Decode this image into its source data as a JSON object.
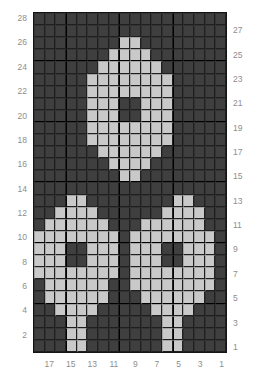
{
  "chart": {
    "type": "grid-pattern",
    "columns": 18,
    "rows": 28,
    "colors": {
      "background_stitch": "#3f3f3f",
      "motif_stitch": "#c9c9c9",
      "gridline": "#1f1f1f",
      "heavy_gridline": "#000000",
      "label": "#8e8e8e"
    },
    "left_axis_labels": [
      "28",
      "26",
      "24",
      "22",
      "20",
      "18",
      "16",
      "14",
      "12",
      "10",
      "8",
      "6",
      "4",
      "2"
    ],
    "right_axis_labels": [
      "27",
      "25",
      "23",
      "21",
      "19",
      "17",
      "15",
      "13",
      "11",
      "9",
      "7",
      "5",
      "3",
      "1"
    ],
    "bottom_axis_labels": [
      "17",
      "15",
      "13",
      "11",
      "9",
      "7",
      "5",
      "3",
      "1"
    ],
    "left_axis_rows": [
      28,
      26,
      24,
      22,
      20,
      18,
      16,
      14,
      12,
      10,
      8,
      6,
      4,
      2
    ],
    "right_axis_rows": [
      27,
      25,
      23,
      21,
      19,
      17,
      15,
      13,
      11,
      9,
      7,
      5,
      3,
      1
    ],
    "bottom_axis_columns": [
      17,
      15,
      13,
      11,
      9,
      7,
      5,
      3,
      1
    ],
    "legend": {
      "dark": "background stitch",
      "light": "contrast stitch"
    },
    "grid": [
      "000000000000000000",
      "000000000000000000",
      "000000001100000000",
      "000000011110000000",
      "000000111111000000",
      "000001111111100000",
      "000001111111100000",
      "000001110011100000",
      "000001110011100000",
      "000001111111100000",
      "000001111111100000",
      "000000111111000000",
      "000000011110000000",
      "000000001100000000",
      "000000000000000000",
      "000110000000011000",
      "001111000000111100",
      "011111100011111100",
      "111111110111111110",
      "111001110111001110",
      "111001110111001110",
      "111111110111111110",
      "011111100111111110",
      "011111100011111100",
      "001111000001111000",
      "000110000000110000",
      "000110000000110000",
      "000110000000110000"
    ]
  }
}
